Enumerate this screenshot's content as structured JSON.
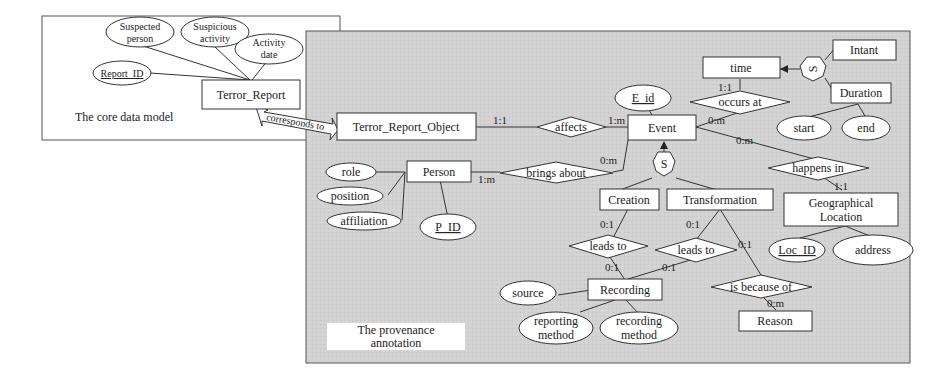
{
  "core": {
    "caption": "The core data model",
    "entity": "Terror_Report",
    "attributes": [
      "Suspected person",
      "Suspicious activity",
      "Activity date"
    ],
    "key_attribute": "Report_ID"
  },
  "link": {
    "label": "corresponds to"
  },
  "provenance": {
    "caption_line1": "The provenance",
    "caption_line2": "annotation",
    "entities": {
      "tro": "Terror_Report_Object",
      "event": "Event",
      "person": "Person",
      "time": "time",
      "intant": "Intant",
      "duration": "Duration",
      "creation": "Creation",
      "transformation": "Transformation",
      "geo_line1": "Geographical",
      "geo_line2": "Location",
      "recording": "Recording",
      "reason": "Reason"
    },
    "relationships": {
      "affects": "affects",
      "brings_about": "brings about",
      "occurs_at": "occurs at",
      "happens_in": "happens in",
      "leads_to_1": "leads to",
      "leads_to_2": "leads to",
      "is_because_of": "is because of"
    },
    "attributes": {
      "e_id": "E_id",
      "role": "role",
      "position": "position",
      "affiliation": "affiliation",
      "p_id": "P_ID",
      "start": "start",
      "end": "end",
      "loc_id": "Loc_ID",
      "address": "address",
      "source": "source",
      "reporting_1": "reporting",
      "reporting_2": "method",
      "recording_1": "recording",
      "recording_2": "method"
    },
    "specialization": {
      "symbol": "S"
    },
    "cardinalities": {
      "tro_affects": "1:1",
      "event_affects": "1:m",
      "person_brings": "1:m",
      "event_brings": "0:m",
      "time_occurs": "1:1",
      "event_occurs": "0:m",
      "event_happens": "0:m",
      "geo_happens": "1:1",
      "creation_leads": "0:1",
      "recording_leads1": "0:1",
      "transformation_leads": "0:1",
      "recording_leads2": "0:1",
      "transformation_because": "0:1",
      "reason_because": "0:m"
    }
  }
}
